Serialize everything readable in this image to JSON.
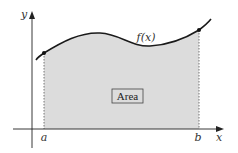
{
  "diagram": {
    "axes": {
      "x_label": "x",
      "y_label": "y"
    },
    "function_label": "f(x)",
    "bounds": {
      "lower": "a",
      "upper": "b"
    },
    "region_label": "Area",
    "colors": {
      "curve": "#1a1a1a",
      "fill": "#dcdcdc",
      "axis": "#222222",
      "dotted": "#555555",
      "box_border": "#444444"
    }
  }
}
